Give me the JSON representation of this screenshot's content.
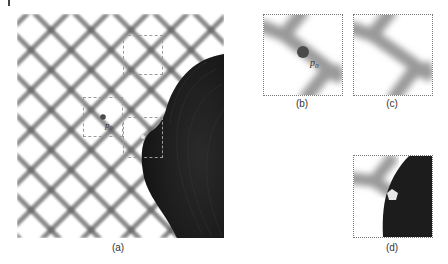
{
  "figure": {
    "panels": [
      {
        "id": "a",
        "caption": "(a)",
        "description": "diamond chain-link fence with dark occluding object on right"
      },
      {
        "id": "b",
        "caption": "(b)",
        "description": "zoomed patch around point p0"
      },
      {
        "id": "c",
        "caption": "(c)",
        "description": "zoomed similar fence patch"
      },
      {
        "id": "d",
        "caption": "(d)",
        "description": "zoomed patch at boundary of dark object"
      }
    ],
    "point_label": "p",
    "point_subscript": "0",
    "colors": {
      "background": "#ffffff",
      "fence_wire": "#8c8c8c",
      "object": "#1e1e1e",
      "point_marker": "#4a4a4a",
      "pentagon_marker": "#e6e6e6",
      "dashed_box": "#9a9a9a"
    }
  }
}
